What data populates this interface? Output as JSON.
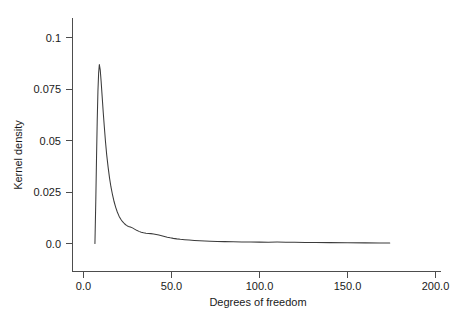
{
  "chart_data": {
    "type": "line",
    "title": "",
    "subtitle": "",
    "xlabel": "Degrees of freedom",
    "ylabel": "Kernel density",
    "xlim": [
      0.0,
      200.0
    ],
    "ylim": [
      0.0,
      0.108
    ],
    "grid": false,
    "legend": null,
    "legend_position": "none",
    "x_ticks": [
      0.0,
      50.0,
      100.0,
      150.0,
      200.0
    ],
    "x_tick_labels": [
      "0.0",
      "50.0",
      "100.0",
      "150.0",
      "200.0"
    ],
    "y_ticks": [
      0.0,
      0.025,
      0.05,
      0.075,
      0.1
    ],
    "y_tick_labels": [
      "0.0",
      "0.025",
      "0.05",
      "0.075",
      "0.1"
    ],
    "annotations": [],
    "series": [
      {
        "name": "Kernel density of degrees of freedom",
        "color": "#3b3b3b",
        "x": [
          6.5,
          7.0,
          7.4,
          7.8,
          8.2,
          8.6,
          9.0,
          9.5,
          10.0,
          10.6,
          11.2,
          11.8,
          12.5,
          13.2,
          14.0,
          14.8,
          15.6,
          16.5,
          17.4,
          18.3,
          19.2,
          20.2,
          21.2,
          22.2,
          23.3,
          24.4,
          25.5,
          26.6,
          27.8,
          29.0,
          30.2,
          31.5,
          32.8,
          34.1,
          35.5,
          36.9,
          38.3,
          39.8,
          41.3,
          42.8,
          44.4,
          46.0,
          47.6,
          49.3,
          51.0,
          53.0,
          55.0,
          57.5,
          60.0,
          63.0,
          66.0,
          69.0,
          72.0,
          76.0,
          80.0,
          85.0,
          90.0,
          95.0,
          100.0,
          105.0,
          110.0,
          115.0,
          120.0,
          126.0,
          132.0,
          140.0,
          150.0,
          160.0,
          168.0,
          174.0
        ],
        "y": [
          0.0,
          0.0215,
          0.0415,
          0.06,
          0.074,
          0.083,
          0.087,
          0.0845,
          0.079,
          0.0715,
          0.064,
          0.057,
          0.0495,
          0.043,
          0.037,
          0.0318,
          0.0275,
          0.0236,
          0.0203,
          0.0176,
          0.0153,
          0.0133,
          0.0118,
          0.0106,
          0.0096,
          0.0088,
          0.0083,
          0.008,
          0.0076,
          0.007,
          0.0064,
          0.0059,
          0.0055,
          0.0052,
          0.005,
          0.0049,
          0.0048,
          0.00465,
          0.0044,
          0.0041,
          0.00375,
          0.0034,
          0.00305,
          0.00275,
          0.0025,
          0.00225,
          0.00205,
          0.00185,
          0.00168,
          0.0015,
          0.00135,
          0.00122,
          0.00112,
          0.001,
          0.00092,
          0.00082,
          0.00075,
          0.0007,
          0.00066,
          0.00064,
          0.00068,
          0.00064,
          0.00058,
          0.00052,
          0.00048,
          0.00042,
          0.00036,
          0.0003,
          0.00026,
          0.00024
        ]
      }
    ],
    "notes": {
      "peak_x": 9.0,
      "peak_y": 0.087,
      "curve_start_x": 6.5,
      "curve_end_x": 174.0
    }
  },
  "axes": {
    "y_axis_title": "Kernel density",
    "x_axis_title": "Degrees of freedom"
  }
}
